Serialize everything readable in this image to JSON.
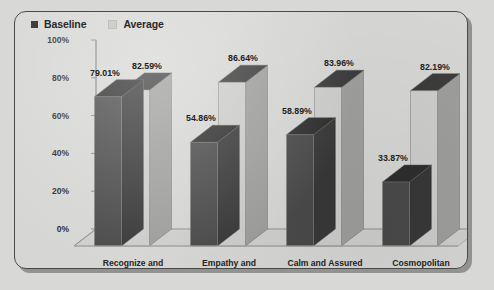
{
  "chart_data": {
    "type": "bar",
    "title": "",
    "subtitle": "",
    "xlabel": "",
    "ylabel": "",
    "categories": [
      "Recognize and\nRespect",
      "Empathy and\nWarmth",
      "Calm and Assured",
      "Cosmopolitan"
    ],
    "series": [
      {
        "name": "Baseline",
        "color": "#4a4a4a",
        "values": [
          79.01,
          54.86,
          58.89,
          33.87
        ],
        "labels": [
          "79.01%",
          "54.86%",
          "58.89%",
          "33.87%"
        ]
      },
      {
        "name": "Average",
        "color": "#c9c9c7",
        "values": [
          82.59,
          86.64,
          83.96,
          82.19
        ],
        "labels": [
          "82.59%",
          "86.64%",
          "83.96%",
          "82.19%"
        ]
      }
    ],
    "ylim": [
      0,
      100
    ],
    "yticks": [
      0,
      20,
      40,
      60,
      80,
      100
    ],
    "ytick_labels": [
      "0%",
      "20%",
      "40%",
      "60%",
      "80%",
      "100%"
    ],
    "grid": false,
    "legend_position": "top-left",
    "style": "3d-grouped-bar"
  },
  "legend": {
    "items": [
      {
        "label": "Baseline",
        "swatch": "#3f3f3f"
      },
      {
        "label": "Average",
        "swatch": "#cfcfcd"
      }
    ]
  },
  "colors": {
    "background": "#d6d6d4",
    "page_background": "#d8d8d6",
    "border": "#4a4a4a",
    "baseline_front": "#4a4a4a",
    "baseline_top": "#2e2e2e",
    "baseline_side": "#383838",
    "average_front": "#cdcdcb",
    "average_top": "#3c3c3c",
    "average_side": "#9e9e9c",
    "axis": "#8a8a88",
    "text": "#242424"
  }
}
